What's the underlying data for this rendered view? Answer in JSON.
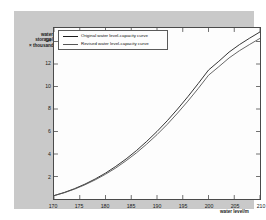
{
  "chart_data": {
    "type": "line",
    "title": "",
    "xlabel": "water level/m",
    "ylabel_lines": [
      "water",
      "storage/",
      "× thousand"
    ],
    "ylabel": "water storage/× thousand",
    "xlim": [
      170,
      210
    ],
    "ylim": [
      0,
      15.2
    ],
    "xticks": [
      170,
      175,
      180,
      185,
      190,
      195,
      200,
      205,
      210
    ],
    "xtick_labels": [
      "170",
      "175",
      "180",
      "185",
      "190",
      "195",
      "200",
      "205",
      "210"
    ],
    "yticks": [
      2,
      4,
      6,
      8,
      10,
      12,
      14
    ],
    "ytick_labels": [
      "2",
      "4",
      "6",
      "8",
      "10",
      "12",
      "14"
    ],
    "grid": false,
    "legend_position": "upper-left",
    "x": [
      170,
      172,
      174,
      176,
      178,
      180,
      182,
      184,
      186,
      188,
      190,
      192,
      194,
      196,
      198,
      200,
      202,
      204,
      206,
      208,
      210
    ],
    "series": [
      {
        "name": "Original water level-capacity curve",
        "color": "#1c1c1c",
        "values": [
          0.3,
          0.58,
          0.92,
          1.32,
          1.78,
          2.3,
          2.9,
          3.56,
          4.3,
          5.12,
          6.0,
          6.96,
          8.0,
          9.1,
          10.26,
          11.46,
          12.24,
          13.06,
          13.72,
          14.3,
          14.85
        ]
      },
      {
        "name": "Revised water level-capacity curve",
        "color": "#555555",
        "values": [
          0.3,
          0.56,
          0.88,
          1.26,
          1.7,
          2.2,
          2.76,
          3.4,
          4.1,
          4.88,
          5.72,
          6.64,
          7.64,
          8.7,
          9.82,
          11.0,
          11.76,
          12.54,
          13.18,
          13.74,
          14.28
        ]
      }
    ]
  },
  "legend": {
    "entries": [
      {
        "label": "Original water level-capacity curve"
      },
      {
        "label": "Revised water level-capacity curve"
      }
    ]
  },
  "colors": {
    "figure_background": "#c9c9c9",
    "axes_background": "#fdfdfd",
    "axes_frame": "#4a4a4a",
    "series_original": "#1c1c1c",
    "series_revised": "#555555"
  }
}
